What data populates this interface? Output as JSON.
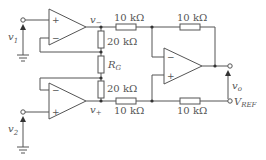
{
  "diagram": {
    "type": "instrumentation-amplifier-circuit",
    "colors": {
      "wire": "#555555",
      "background": "#ffffff"
    },
    "opamps": [
      {
        "id": "opamp-1",
        "plus_label": "+",
        "minus_label": "−"
      },
      {
        "id": "opamp-2",
        "plus_label": "+",
        "minus_label": "−"
      },
      {
        "id": "opamp-3",
        "plus_label": "+",
        "minus_label": "−"
      }
    ],
    "inputs": {
      "v1": {
        "main": "v",
        "sub": "1"
      },
      "v2": {
        "main": "v",
        "sub": "2"
      }
    },
    "nodes": {
      "v_minus": {
        "main": "v",
        "sub": "−"
      },
      "v_plus": {
        "main": "v",
        "sub": "+"
      },
      "v_o": {
        "main": "v",
        "sub": "o"
      },
      "v_ref": {
        "main": "V",
        "sub": "REF"
      }
    },
    "resistors": {
      "r_top_in": "10 kΩ",
      "r_top_fb": "10 kΩ",
      "r_upper_20k": "20 kΩ",
      "r_gain_main": "R",
      "r_gain_sub": "G",
      "r_lower_20k": "20 kΩ",
      "r_bot_in": "10 kΩ",
      "r_bot_ref": "10 kΩ"
    }
  }
}
